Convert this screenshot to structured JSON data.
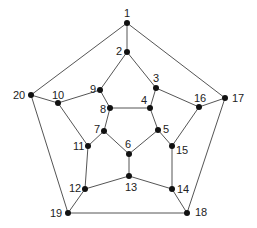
{
  "graph": {
    "name": "dodecahedral graph",
    "edge_color": "#555555",
    "node_color": "#111111",
    "nodes": [
      {
        "id": "1",
        "x": 127,
        "y": 23,
        "lx": 124,
        "ly": 17
      },
      {
        "id": "2",
        "x": 127,
        "y": 52,
        "lx": 116,
        "ly": 55
      },
      {
        "id": "3",
        "x": 156,
        "y": 88,
        "lx": 153,
        "ly": 82
      },
      {
        "id": "4",
        "x": 150,
        "y": 108,
        "lx": 141,
        "ly": 104
      },
      {
        "id": "5",
        "x": 158,
        "y": 130,
        "lx": 163,
        "ly": 133
      },
      {
        "id": "6",
        "x": 129,
        "y": 154,
        "lx": 125,
        "ly": 148
      },
      {
        "id": "7",
        "x": 104,
        "y": 131,
        "lx": 94,
        "ly": 133
      },
      {
        "id": "8",
        "x": 110,
        "y": 108,
        "lx": 100,
        "ly": 113
      },
      {
        "id": "9",
        "x": 100,
        "y": 90,
        "lx": 90,
        "ly": 93
      },
      {
        "id": "10",
        "x": 58,
        "y": 103,
        "lx": 52,
        "ly": 99
      },
      {
        "id": "11",
        "x": 88,
        "y": 146,
        "lx": 73,
        "ly": 150
      },
      {
        "id": "12",
        "x": 85,
        "y": 189,
        "lx": 69,
        "ly": 192
      },
      {
        "id": "13",
        "x": 129,
        "y": 176,
        "lx": 125,
        "ly": 191
      },
      {
        "id": "14",
        "x": 172,
        "y": 189,
        "lx": 177,
        "ly": 193
      },
      {
        "id": "15",
        "x": 172,
        "y": 146,
        "lx": 176,
        "ly": 154
      },
      {
        "id": "16",
        "x": 199,
        "y": 107,
        "lx": 194,
        "ly": 102
      },
      {
        "id": "17",
        "x": 225,
        "y": 98,
        "lx": 232,
        "ly": 102
      },
      {
        "id": "18",
        "x": 187,
        "y": 213,
        "lx": 195,
        "ly": 216
      },
      {
        "id": "19",
        "x": 68,
        "y": 213,
        "lx": 50,
        "ly": 217
      },
      {
        "id": "20",
        "x": 31,
        "y": 95,
        "lx": 13,
        "ly": 99
      }
    ],
    "edges": [
      [
        "1",
        "2"
      ],
      [
        "1",
        "20"
      ],
      [
        "1",
        "17"
      ],
      [
        "2",
        "9"
      ],
      [
        "2",
        "3"
      ],
      [
        "3",
        "4"
      ],
      [
        "3",
        "16"
      ],
      [
        "4",
        "8"
      ],
      [
        "4",
        "5"
      ],
      [
        "5",
        "6"
      ],
      [
        "5",
        "15"
      ],
      [
        "6",
        "7"
      ],
      [
        "6",
        "13"
      ],
      [
        "7",
        "8"
      ],
      [
        "7",
        "11"
      ],
      [
        "8",
        "9"
      ],
      [
        "9",
        "10"
      ],
      [
        "10",
        "20"
      ],
      [
        "10",
        "11"
      ],
      [
        "11",
        "12"
      ],
      [
        "12",
        "13"
      ],
      [
        "12",
        "19"
      ],
      [
        "13",
        "14"
      ],
      [
        "14",
        "15"
      ],
      [
        "14",
        "18"
      ],
      [
        "15",
        "16"
      ],
      [
        "16",
        "17"
      ],
      [
        "17",
        "18"
      ],
      [
        "18",
        "19"
      ],
      [
        "19",
        "20"
      ]
    ]
  }
}
